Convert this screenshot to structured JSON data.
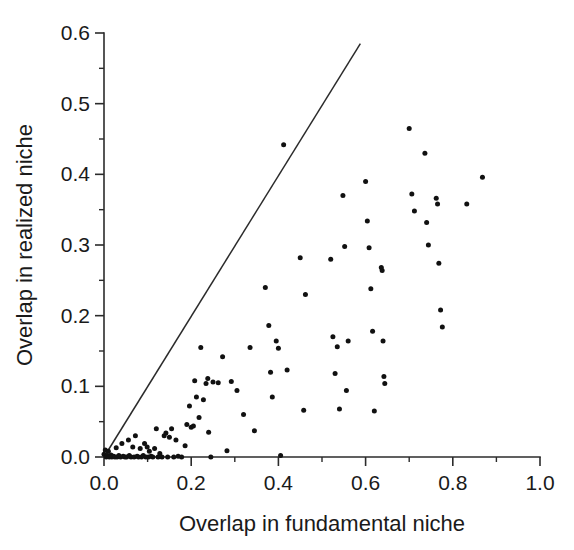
{
  "chart_data": {
    "type": "scatter",
    "title": "",
    "xlabel": "Overlap in fundamental niche",
    "ylabel": "Overlap in realized niche",
    "xlim": [
      0.0,
      1.0
    ],
    "ylim": [
      0.0,
      0.6
    ],
    "xticks": [
      "0.0",
      "0.2",
      "0.4",
      "0.6",
      "0.8",
      "1.0"
    ],
    "xtick_values": [
      0.0,
      0.2,
      0.4,
      0.6,
      0.8,
      1.0
    ],
    "xminor_values": [
      0.1,
      0.3,
      0.5,
      0.7,
      0.9
    ],
    "yticks": [
      "0.0",
      "0.1",
      "0.2",
      "0.3",
      "0.4",
      "0.5",
      "0.6"
    ],
    "ytick_values": [
      0.0,
      0.1,
      0.2,
      0.3,
      0.4,
      0.5,
      0.6
    ],
    "yminor_values": [
      0.05,
      0.15,
      0.25,
      0.35,
      0.45,
      0.55
    ],
    "grid": false,
    "legend": null,
    "marker": "filled-circle",
    "marker_color": "#111111",
    "marker_size_px": 5,
    "reference_line": {
      "name": "one-to-one-line",
      "from": [
        0.0,
        0.0
      ],
      "to": [
        0.588,
        0.585
      ],
      "color": "#2b2b2b"
    },
    "points": [
      [
        0.0,
        0.004
      ],
      [
        0.003,
        0.01
      ],
      [
        0.005,
        0.0
      ],
      [
        0.008,
        0.002
      ],
      [
        0.01,
        0.008
      ],
      [
        0.012,
        0.0
      ],
      [
        0.016,
        0.003
      ],
      [
        0.018,
        0.0
      ],
      [
        0.022,
        0.001
      ],
      [
        0.025,
        0.0
      ],
      [
        0.028,
        0.013
      ],
      [
        0.03,
        0.0
      ],
      [
        0.034,
        0.002
      ],
      [
        0.038,
        0.0
      ],
      [
        0.041,
        0.019
      ],
      [
        0.044,
        0.001
      ],
      [
        0.048,
        0.0
      ],
      [
        0.052,
        0.0
      ],
      [
        0.056,
        0.024
      ],
      [
        0.058,
        0.002
      ],
      [
        0.062,
        0.0
      ],
      [
        0.066,
        0.014
      ],
      [
        0.069,
        0.0
      ],
      [
        0.072,
        0.03
      ],
      [
        0.076,
        0.001
      ],
      [
        0.079,
        0.0
      ],
      [
        0.083,
        0.012
      ],
      [
        0.086,
        0.0
      ],
      [
        0.09,
        0.002
      ],
      [
        0.093,
        0.019
      ],
      [
        0.096,
        0.0
      ],
      [
        0.099,
        0.014
      ],
      [
        0.102,
        0.0
      ],
      [
        0.104,
        0.008
      ],
      [
        0.108,
        0.001
      ],
      [
        0.112,
        0.0
      ],
      [
        0.116,
        0.012
      ],
      [
        0.12,
        0.04
      ],
      [
        0.124,
        0.0
      ],
      [
        0.128,
        0.005
      ],
      [
        0.133,
        0.0
      ],
      [
        0.138,
        0.03
      ],
      [
        0.142,
        0.034
      ],
      [
        0.146,
        0.0
      ],
      [
        0.15,
        0.028
      ],
      [
        0.155,
        0.04
      ],
      [
        0.16,
        0.0
      ],
      [
        0.165,
        0.024
      ],
      [
        0.17,
        0.001
      ],
      [
        0.178,
        0.0
      ],
      [
        0.186,
        0.016
      ],
      [
        0.19,
        0.046
      ],
      [
        0.196,
        0.072
      ],
      [
        0.2,
        0.042
      ],
      [
        0.205,
        0.044
      ],
      [
        0.208,
        0.108
      ],
      [
        0.212,
        0.085
      ],
      [
        0.218,
        0.056
      ],
      [
        0.222,
        0.155
      ],
      [
        0.228,
        0.081
      ],
      [
        0.234,
        0.104
      ],
      [
        0.238,
        0.111
      ],
      [
        0.24,
        0.035
      ],
      [
        0.245,
        0.0
      ],
      [
        0.25,
        0.106
      ],
      [
        0.262,
        0.105
      ],
      [
        0.272,
        0.142
      ],
      [
        0.282,
        0.009
      ],
      [
        0.292,
        0.107
      ],
      [
        0.305,
        0.094
      ],
      [
        0.32,
        0.06
      ],
      [
        0.335,
        0.155
      ],
      [
        0.345,
        0.037
      ],
      [
        0.37,
        0.24
      ],
      [
        0.378,
        0.186
      ],
      [
        0.382,
        0.12
      ],
      [
        0.386,
        0.085
      ],
      [
        0.395,
        0.164
      ],
      [
        0.4,
        0.154
      ],
      [
        0.405,
        0.002
      ],
      [
        0.412,
        0.442
      ],
      [
        0.42,
        0.123
      ],
      [
        0.45,
        0.282
      ],
      [
        0.458,
        0.066
      ],
      [
        0.462,
        0.23
      ],
      [
        0.52,
        0.28
      ],
      [
        0.525,
        0.17
      ],
      [
        0.53,
        0.118
      ],
      [
        0.535,
        0.156
      ],
      [
        0.54,
        0.068
      ],
      [
        0.548,
        0.37
      ],
      [
        0.552,
        0.298
      ],
      [
        0.556,
        0.094
      ],
      [
        0.56,
        0.164
      ],
      [
        0.6,
        0.39
      ],
      [
        0.604,
        0.334
      ],
      [
        0.608,
        0.296
      ],
      [
        0.612,
        0.238
      ],
      [
        0.616,
        0.178
      ],
      [
        0.62,
        0.065
      ],
      [
        0.636,
        0.268
      ],
      [
        0.638,
        0.264
      ],
      [
        0.64,
        0.164
      ],
      [
        0.642,
        0.114
      ],
      [
        0.644,
        0.104
      ],
      [
        0.7,
        0.465
      ],
      [
        0.706,
        0.372
      ],
      [
        0.712,
        0.348
      ],
      [
        0.736,
        0.43
      ],
      [
        0.74,
        0.332
      ],
      [
        0.744,
        0.3
      ],
      [
        0.762,
        0.366
      ],
      [
        0.765,
        0.358
      ],
      [
        0.768,
        0.274
      ],
      [
        0.772,
        0.208
      ],
      [
        0.776,
        0.184
      ],
      [
        0.832,
        0.358
      ],
      [
        0.868,
        0.396
      ]
    ],
    "n_points": 118
  }
}
